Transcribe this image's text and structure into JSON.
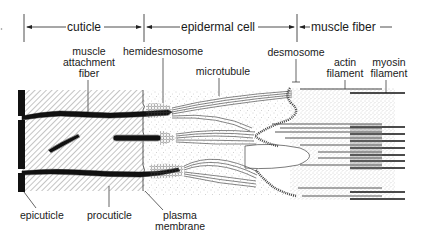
{
  "regions": [
    {
      "id": "cuticle",
      "label": "cuticle"
    },
    {
      "id": "epidermal-cell",
      "label": "epidermal cell"
    },
    {
      "id": "muscle-fiber",
      "label": "muscle fiber"
    }
  ],
  "labels": {
    "muscle_attachment_fiber": [
      "muscle",
      "attachment",
      "fiber"
    ],
    "hemidesmosome": "hemidesmosome",
    "microtubule": "microtubule",
    "desmosome": "desmosome",
    "actin_filament": [
      "actin",
      "filament"
    ],
    "myosin_filament": [
      "myosin",
      "filament"
    ],
    "epicuticle": "epicuticle",
    "procuticle": "procuticle",
    "plasma_membrane": [
      "plasma",
      "membrane"
    ]
  },
  "colors": {
    "ink": "#1a1a1a",
    "background": "#ffffff",
    "stipple": "#9a9a9a"
  }
}
